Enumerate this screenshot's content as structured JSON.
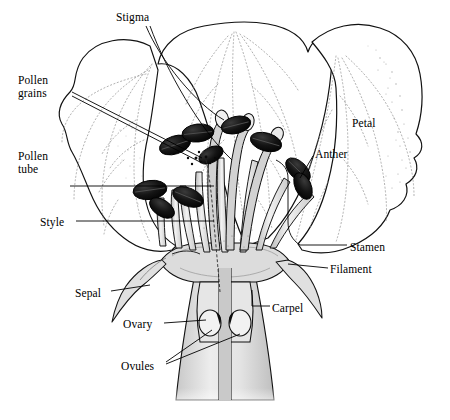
{
  "figure": {
    "style": "pen-and-ink botanical line drawing",
    "background_color": "#ffffff",
    "ink_color": "#000000",
    "fill_light_gray": "#dcdcdc",
    "fill_mid_gray": "#b4b4b4",
    "anther_color": "#111111"
  },
  "labels": [
    {
      "id": "stigma",
      "text": "Stigma",
      "x": 116,
      "y": 11,
      "align": "left"
    },
    {
      "id": "pollen-grains",
      "text": "Pollen\ngrains",
      "x": 18,
      "y": 74,
      "align": "left"
    },
    {
      "id": "pollen-tube",
      "text": "Pollen\ntube",
      "x": 18,
      "y": 150,
      "align": "left"
    },
    {
      "id": "style",
      "text": "Style",
      "x": 40,
      "y": 216,
      "align": "left"
    },
    {
      "id": "sepal",
      "text": "Sepal",
      "x": 75,
      "y": 287,
      "align": "left"
    },
    {
      "id": "ovary",
      "text": "Ovary",
      "x": 123,
      "y": 318,
      "align": "left"
    },
    {
      "id": "ovules",
      "text": "Ovules",
      "x": 121,
      "y": 360,
      "align": "left"
    },
    {
      "id": "petal",
      "text": "Petal",
      "x": 352,
      "y": 117,
      "align": "left"
    },
    {
      "id": "anther",
      "text": "Anther",
      "x": 315,
      "y": 148,
      "align": "left"
    },
    {
      "id": "stamen",
      "text": "Stamen",
      "x": 350,
      "y": 241,
      "align": "left"
    },
    {
      "id": "filament",
      "text": "Filament",
      "x": 330,
      "y": 263,
      "align": "left"
    },
    {
      "id": "carpel",
      "text": "Carpel",
      "x": 272,
      "y": 302,
      "align": "left"
    }
  ],
  "parts": [
    {
      "id": "petal",
      "name": "Petal",
      "description": "three broad ruffled petals forming the corolla backdrop"
    },
    {
      "id": "stamen",
      "name": "Stamen",
      "description": "anther plus filament, the male reproductive organ"
    },
    {
      "id": "carpel",
      "name": "Carpel",
      "description": "stigma, style and ovary, the female reproductive organ"
    },
    {
      "id": "sepal",
      "name": "Sepal",
      "description": "narrow recurved bract below the petals"
    }
  ]
}
